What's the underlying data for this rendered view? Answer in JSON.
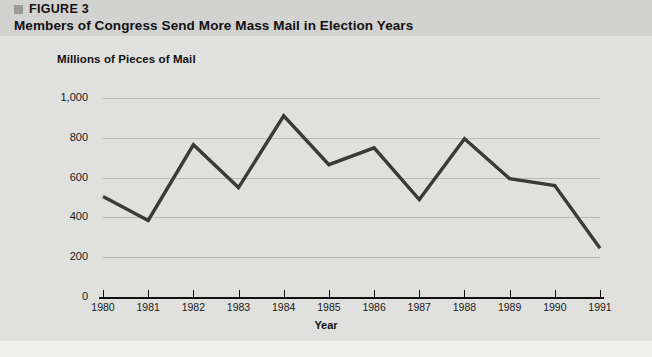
{
  "header": {
    "figure_label": "FIGURE 3",
    "title": "Members of Congress Send More Mass Mail in Election Years",
    "bullet_color": "#9a9a98",
    "band_color": "#d2d2d0"
  },
  "chart_data": {
    "type": "line",
    "title": "Members of Congress Send More Mass Mail in Election Years",
    "subtitle": "Millions of Pieces of Mail",
    "xlabel": "Year",
    "ylabel": "Millions of Pieces of Mail",
    "categories": [
      "1980",
      "1981",
      "1982",
      "1983",
      "1984",
      "1985",
      "1986",
      "1987",
      "1988",
      "1989",
      "1990",
      "1991"
    ],
    "values": [
      505,
      385,
      765,
      550,
      910,
      665,
      750,
      490,
      795,
      595,
      560,
      245
    ],
    "series": [
      {
        "name": "Mass mail pieces",
        "values": [
          505,
          385,
          765,
          550,
          910,
          665,
          750,
          490,
          795,
          595,
          560,
          245
        ]
      }
    ],
    "ylim": [
      0,
      1000
    ],
    "ytick_values": [
      0,
      200,
      400,
      600,
      800,
      1000
    ],
    "ytick_labels": [
      "0",
      "200",
      "400",
      "600",
      "800",
      "1,000"
    ],
    "grid": true,
    "legend": false,
    "legend_position": "none",
    "line_color": "#3a3a38",
    "plot_background": "#e0e0de"
  }
}
